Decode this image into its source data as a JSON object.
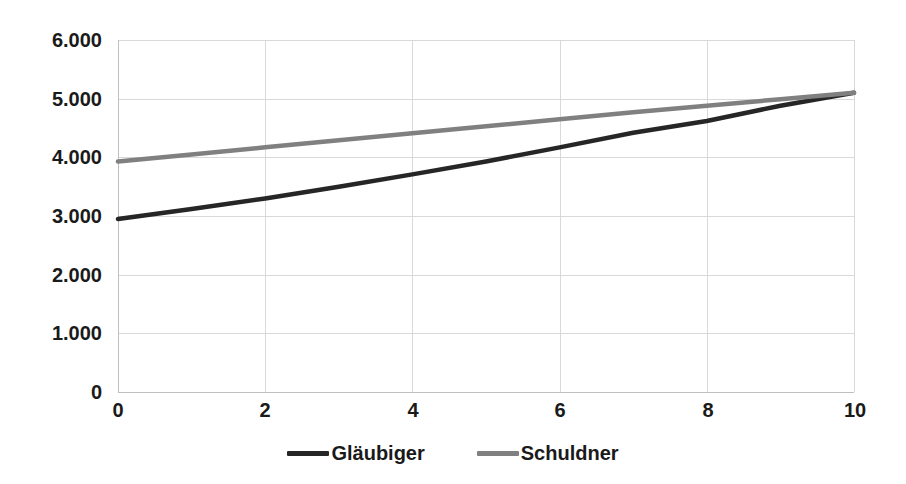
{
  "chart_data": {
    "type": "line",
    "title": "",
    "xlabel": "",
    "ylabel": "",
    "xlim": [
      0,
      10
    ],
    "ylim": [
      0,
      6000
    ],
    "grid": true,
    "legend_position": "bottom",
    "x_tick_labels": [
      "0",
      "2",
      "4",
      "6",
      "8",
      "10"
    ],
    "x_ticks": [
      0,
      2,
      4,
      6,
      8,
      10
    ],
    "y_tick_labels": [
      "6.000",
      "5.000",
      "4.000",
      "3.000",
      "2.000",
      "1.000",
      "0"
    ],
    "y_ticks": [
      6000,
      5000,
      4000,
      3000,
      2000,
      1000,
      0
    ],
    "x": [
      0,
      1,
      2,
      3,
      4,
      5,
      6,
      7,
      8,
      9,
      10
    ],
    "series": [
      {
        "name": "Gläubiger",
        "color": "#262626",
        "values": [
          2950,
          3120,
          3300,
          3500,
          3710,
          3930,
          4170,
          4420,
          4620,
          4880,
          5100
        ]
      },
      {
        "name": "Schuldner",
        "color": "#808080",
        "values": [
          3930,
          4050,
          4170,
          4290,
          4410,
          4530,
          4650,
          4770,
          4880,
          4990,
          5100
        ]
      }
    ]
  },
  "legend": {
    "items": [
      {
        "label": "Gläubiger",
        "color": "#262626"
      },
      {
        "label": "Schuldner",
        "color": "#808080"
      }
    ]
  },
  "axes": {
    "grid_color": "#d9d9d9",
    "axis_color": "#bfbfbf",
    "tick_text_color": "#1a1a1a"
  }
}
